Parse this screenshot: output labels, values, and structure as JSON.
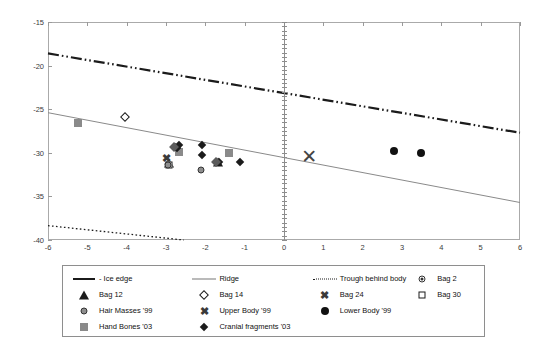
{
  "chart_data": {
    "type": "scatter",
    "title": "",
    "xlabel": "",
    "ylabel": "",
    "xlim": [
      -6,
      6
    ],
    "ylim": [
      -40,
      -15
    ],
    "grid": false,
    "legend_position": "bottom",
    "xticks": [
      "-6",
      "-5",
      "-4",
      "-3",
      "-2",
      "-1",
      "0",
      "1",
      "2",
      "3",
      "4",
      "5",
      "6"
    ],
    "yticks": [
      "-15",
      "-20",
      "-25",
      "-30",
      "-35",
      "-40"
    ],
    "lines": [
      {
        "name": "Ice edge",
        "style": "dash-dot-dot",
        "color": "#1b1b1b",
        "width": 2.2,
        "points": [
          [
            -6,
            -18.6
          ],
          [
            6,
            -27.7
          ]
        ]
      },
      {
        "name": "Ridge",
        "style": "solid",
        "color": "#8a8a8a",
        "width": 1,
        "points": [
          [
            -6,
            -25.4
          ],
          [
            6,
            -35.7
          ]
        ]
      },
      {
        "name": "Trough behind body",
        "style": "dotted",
        "color": "#1b1b1b",
        "width": 1.3,
        "points": [
          [
            -6,
            -38.35
          ],
          [
            -2.55,
            -40
          ]
        ]
      }
    ],
    "series": [
      {
        "name": "Bag 2",
        "marker": "circle-dot",
        "points": [
          [
            -2.95,
            -31.3
          ]
        ]
      },
      {
        "name": "Bag 12",
        "marker": "triangle-solid",
        "points": [
          [
            -1.68,
            -31.1
          ],
          [
            -2.92,
            -31.2
          ]
        ]
      },
      {
        "name": "Bag 14",
        "marker": "diamond-open",
        "points": [
          [
            -4.05,
            -25.95
          ]
        ]
      },
      {
        "name": "Bag 24",
        "marker": "x-small",
        "points": [
          [
            -2.98,
            -30.6
          ]
        ]
      },
      {
        "name": "Bag 30",
        "marker": "square-open",
        "points": [
          [
            -2.92,
            -31.35
          ]
        ]
      },
      {
        "name": "Hair Masses '99",
        "marker": "circle-gray",
        "points": [
          [
            -2.12,
            -32.0
          ],
          [
            -2.95,
            -31.45
          ]
        ]
      },
      {
        "name": "Upper Body '99",
        "marker": "x-large",
        "points": [
          [
            0.64,
            -30.45
          ]
        ]
      },
      {
        "name": "Lower Body '99",
        "marker": "circle-solid",
        "points": [
          [
            2.79,
            -29.85
          ],
          [
            3.48,
            -30.0
          ]
        ]
      },
      {
        "name": "Hand Bones '03",
        "marker": "square-gray",
        "points": [
          [
            -5.24,
            -26.55
          ],
          [
            -2.68,
            -29.95
          ],
          [
            -1.41,
            -30.05
          ]
        ]
      },
      {
        "name": "Cranial fragments '03",
        "marker": "diamond-solid",
        "points": [
          [
            -2.78,
            -29.3
          ],
          [
            -2.72,
            -29.45
          ],
          [
            -2.66,
            -29.1
          ],
          [
            -2.08,
            -29.15
          ],
          [
            -2.09,
            -30.2
          ],
          [
            -1.74,
            -31.05
          ],
          [
            -1.66,
            -31.0
          ],
          [
            -1.12,
            -31.0
          ]
        ]
      },
      {
        "name": "Cranial fragments '03 gray",
        "marker": "diamond-gray",
        "points": [
          [
            -2.79,
            -29.35
          ],
          [
            -1.72,
            -31.0
          ]
        ]
      }
    ]
  },
  "legend": {
    "rows": [
      [
        {
          "symbol": "line-thick-dashdot",
          "label": "- Ice edge"
        },
        {
          "symbol": "line-thin",
          "label": "Ridge"
        },
        {
          "symbol": "line-dotted",
          "label": "Trough behind body"
        },
        {
          "symbol": "circle-dot",
          "label": "Bag 2"
        }
      ],
      [
        {
          "symbol": "triangle-solid",
          "label": "Bag 12"
        },
        {
          "symbol": "diamond-open",
          "label": "Bag 14"
        },
        {
          "symbol": "x-small",
          "label": "Bag 24"
        },
        {
          "symbol": "square-open",
          "label": "Bag 30"
        }
      ],
      [
        {
          "symbol": "circle-gray",
          "label": "Hair Masses '99"
        },
        {
          "symbol": "x-small",
          "label": "Upper Body '99"
        },
        {
          "symbol": "circle-solid",
          "label": "Lower Body '99"
        },
        {
          "symbol": "",
          "label": ""
        }
      ],
      [
        {
          "symbol": "square-gray",
          "label": "Hand Bones '03"
        },
        {
          "symbol": "diamond-solid",
          "label": "Cranial fragments '03"
        },
        {
          "symbol": "",
          "label": ""
        },
        {
          "symbol": "",
          "label": ""
        }
      ]
    ]
  },
  "colors": {
    "frame": "#aaaaaa",
    "ice_edge": "#1b1b1b",
    "ridge": "#8a8a8a",
    "trough": "#1b1b1b",
    "gray_marker": "#8a8a8a",
    "dark_marker": "#1b1b1b"
  }
}
